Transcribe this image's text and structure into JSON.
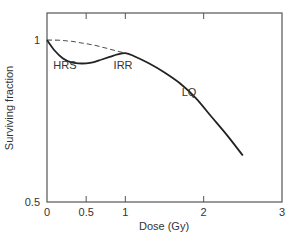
{
  "chart_data": {
    "type": "line",
    "title": "",
    "xlabel": "Dose (Gy)",
    "ylabel": "Surviving fraction",
    "xlim": [
      0,
      3
    ],
    "ylim": [
      0.5,
      1.1
    ],
    "yscale": "log",
    "x_ticks": [
      "0",
      "0.5",
      "1",
      "2",
      "3"
    ],
    "y_ticks": [
      "0.5",
      "1"
    ],
    "grid": false,
    "legend": null,
    "series": [
      {
        "name": "Observed survival (HRS/IRR)",
        "style": "solid",
        "x": [
          0,
          0.1,
          0.2,
          0.3,
          0.4,
          0.5,
          0.6,
          0.7,
          0.8,
          0.9,
          1.0,
          1.1,
          1.3,
          1.5,
          1.7,
          1.9,
          2.1,
          2.3,
          2.5
        ],
        "y": [
          1.0,
          0.955,
          0.925,
          0.91,
          0.905,
          0.905,
          0.91,
          0.92,
          0.93,
          0.94,
          0.945,
          0.935,
          0.905,
          0.87,
          0.83,
          0.78,
          0.72,
          0.665,
          0.61
        ]
      },
      {
        "name": "LQ extrapolation",
        "style": "dashed",
        "x": [
          0,
          0.2,
          0.4,
          0.6,
          0.8,
          1.0
        ],
        "y": [
          1.0,
          0.998,
          0.99,
          0.978,
          0.962,
          0.945
        ]
      }
    ],
    "annotations": [
      {
        "text": "HRS",
        "x": 0.08,
        "y": 0.9
      },
      {
        "text": "IRR",
        "x": 0.85,
        "y": 0.9
      },
      {
        "text": "LQ",
        "x": 1.72,
        "y": 0.8
      }
    ]
  }
}
